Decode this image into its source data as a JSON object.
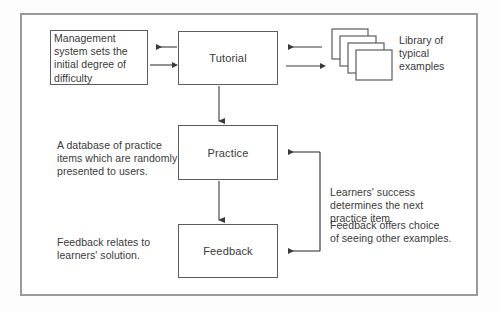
{
  "diagram": {
    "frame": {
      "border_color": "#9a9a9a",
      "background": "#ffffff"
    },
    "line_color": "#5c5c5c",
    "text_color": "#3a3a3a",
    "nodes": [
      {
        "id": "tutorial",
        "label": "Tutorial"
      },
      {
        "id": "practice",
        "label": "Practice"
      },
      {
        "id": "feedback",
        "label": "Feedback"
      }
    ],
    "management_box": {
      "label": "Management\nsystem sets the\ninitial degree of\ndifficulty"
    },
    "library": {
      "icon": "stacked-cards-icon",
      "label": "Library of\ntypical\nexamples",
      "card_count": 4
    },
    "captions": {
      "database": "A database of practice\nitems which are randomly\npresented to users.",
      "feedback_relates": "Feedback relates to\nlearners' solution.",
      "learners_success": "Learners' success\ndetermines the next\npractice item.",
      "feedback_offers": "Feedback offers choice\nof seeing other examples."
    },
    "connectors": [
      {
        "name": "tutorial-to-management",
        "direction": "left",
        "type": "arrow"
      },
      {
        "name": "management-to-tutorial",
        "direction": "right",
        "type": "arrow"
      },
      {
        "name": "library-to-tutorial",
        "direction": "left",
        "type": "arrow"
      },
      {
        "name": "tutorial-to-library",
        "direction": "right",
        "type": "arrow"
      },
      {
        "name": "tutorial-to-practice",
        "direction": "down",
        "type": "arrow"
      },
      {
        "name": "practice-to-feedback",
        "direction": "down",
        "type": "arrow"
      },
      {
        "name": "feedback-loop-to-practice",
        "direction": "left",
        "type": "bracket-arrow"
      },
      {
        "name": "feedback-loop-to-feedback",
        "direction": "left",
        "type": "bracket-arrow"
      }
    ]
  }
}
